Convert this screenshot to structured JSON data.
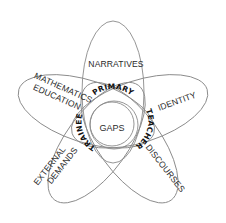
{
  "diagram": {
    "center": {
      "label": "GAPS"
    },
    "ring_text": "PRIMARY TEACHER TRAINEE",
    "ring_parts": [
      "PRIMARY",
      "TEACHER",
      "TRAINEE"
    ],
    "petals": [
      {
        "id": "narratives",
        "label": "NARRATIVES",
        "position": "top"
      },
      {
        "id": "identity",
        "label": "IDENTITY",
        "position": "upper-right"
      },
      {
        "id": "discourses",
        "label": "DISCOURSES",
        "position": "lower-right"
      },
      {
        "id": "external-demands",
        "label_lines": [
          "EXTERNAL",
          "DEMANDS"
        ],
        "position": "lower-left"
      },
      {
        "id": "mathematics-education",
        "label_lines": [
          "MATHEMATICS",
          "EDUCATION"
        ],
        "position": "upper-left"
      }
    ],
    "colors": {
      "outline": "#8a8a8a",
      "text": "#2a2a2a",
      "ring_text": "#111111",
      "background": "#ffffff"
    }
  }
}
